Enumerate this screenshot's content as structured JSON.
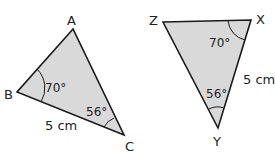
{
  "colors": {
    "fill": "#d9d9d9",
    "stroke": "#1a1a1a"
  },
  "triangle_abc": {
    "vertices": {
      "A": "A",
      "B": "B",
      "C": "C"
    },
    "angle_b": "70°",
    "angle_c": "56°",
    "side_bc": "5 cm"
  },
  "triangle_xyz": {
    "vertices": {
      "X": "X",
      "Y": "Y",
      "Z": "Z"
    },
    "angle_x": "70°",
    "angle_y": "56°",
    "side_xy": "5 cm"
  }
}
